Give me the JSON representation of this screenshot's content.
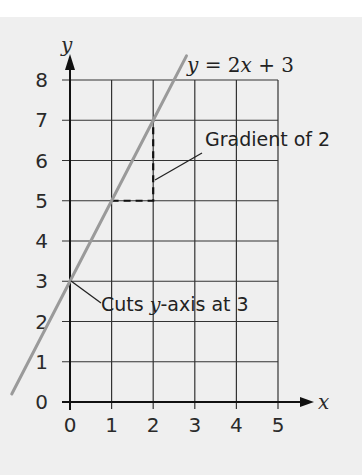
{
  "chart_data": {
    "type": "line",
    "title": "",
    "xlabel": "x",
    "ylabel": "y",
    "xlim": [
      0,
      5
    ],
    "ylim": [
      0,
      8
    ],
    "grid": true,
    "x_ticks": [
      "0",
      "1",
      "2",
      "3",
      "4",
      "5"
    ],
    "y_ticks": [
      "0",
      "1",
      "2",
      "3",
      "4",
      "5",
      "6",
      "7",
      "8"
    ],
    "series": [
      {
        "name": "y = 2x + 3",
        "equation": "y = 2x + 3",
        "color": "#9a9a9a",
        "x": [
          -1.4,
          0,
          1,
          2,
          2.8
        ],
        "y": [
          0.2,
          3,
          5,
          7,
          8.6
        ]
      }
    ],
    "annotations": [
      {
        "text": "y = 2x + 3",
        "target": "line label"
      },
      {
        "text": "Gradient of 2",
        "target": "dashed triangle from (1,5) to (2,5) to (2,7)"
      },
      {
        "text": "Cuts y-axis at 3",
        "target": "point (0,3)"
      }
    ],
    "legend": "none"
  },
  "labels": {
    "equation_y": "y",
    "equation_rest": " = 2",
    "equation_x": "x",
    "equation_tail": " + 3",
    "gradient": "Gradient of 2",
    "cuts_prefix": "Cuts ",
    "cuts_italic": "y",
    "cuts_suffix": "-axis at 3",
    "x_axis_name": "x",
    "y_axis_name": "y"
  },
  "colors": {
    "background": "#efefef",
    "grid": "#333333",
    "line": "#9a9a9a",
    "text": "#222222"
  }
}
